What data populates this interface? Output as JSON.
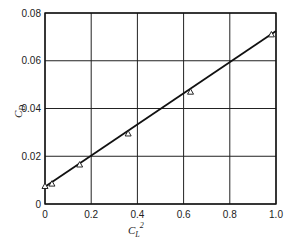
{
  "chart_data": {
    "type": "line",
    "title": "",
    "xlabel": "C_L²",
    "ylabel": "C_D",
    "xlim": [
      0,
      1.0
    ],
    "ylim": [
      0,
      0.08
    ],
    "grid": true,
    "legend": null,
    "x_ticks": [
      "0",
      "0.2",
      "0.4",
      "0.6",
      "0.8",
      "1.0"
    ],
    "y_ticks": [
      "0",
      "0.02",
      "0.04",
      "0.06",
      "0.08"
    ],
    "series": [
      {
        "name": "measured",
        "marker": "triangle-open",
        "x": [
          0.0,
          0.03,
          0.15,
          0.36,
          0.63,
          0.98
        ],
        "y": [
          0.0075,
          0.0085,
          0.0165,
          0.0295,
          0.047,
          0.071
        ]
      },
      {
        "name": "fit",
        "style": "solid-line",
        "x": [
          0.0,
          1.0
        ],
        "y": [
          0.0072,
          0.0725
        ]
      }
    ]
  },
  "labels": {
    "ylabel_main": "C",
    "ylabel_sub": "D",
    "xlabel_main": "C",
    "xlabel_sub": "L",
    "xlabel_sup": "2"
  }
}
